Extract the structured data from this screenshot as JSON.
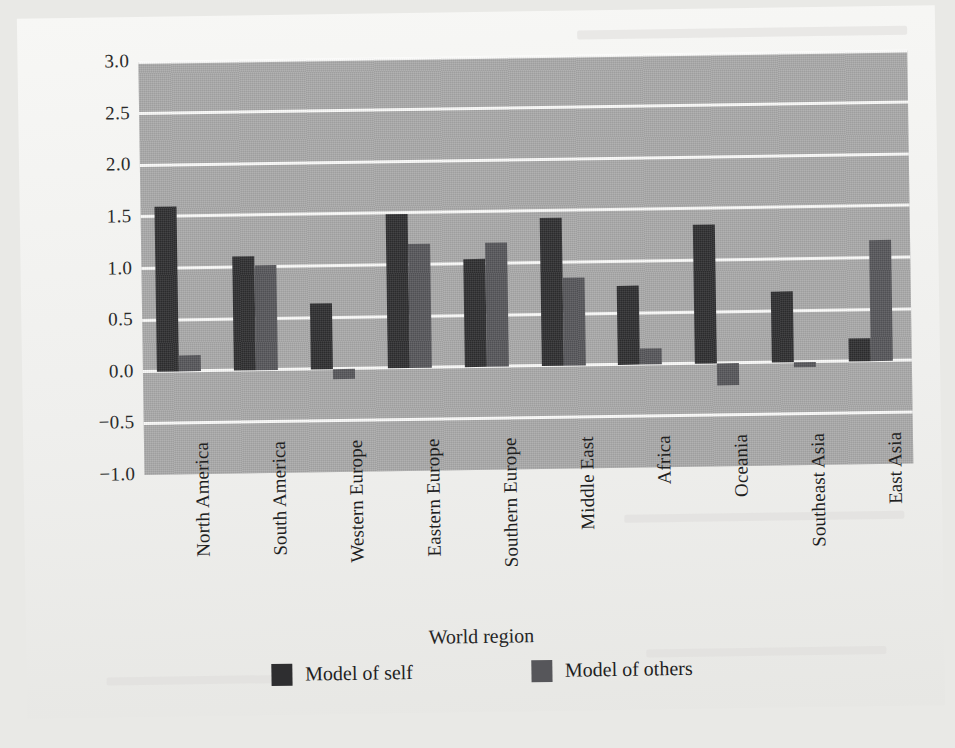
{
  "chart_data": {
    "type": "bar",
    "title": "",
    "xlabel": "World region",
    "ylabel": "Internal working models",
    "ylim": [
      -1.0,
      3.0
    ],
    "ytick_labels": [
      "3.0",
      "2.5",
      "2.0",
      "1.5",
      "1.0",
      "0.5",
      "0.0",
      "-0.5",
      "-1.0"
    ],
    "ytick_values": [
      3.0,
      2.5,
      2.0,
      1.5,
      1.0,
      0.5,
      0.0,
      -0.5,
      -1.0
    ],
    "grid": true,
    "grid_color": "#fbfbfa",
    "plot_background": "#a9a9a9",
    "legend_position": "bottom",
    "categories": [
      "North America",
      "South America",
      "Western Europe",
      "Eastern Europe",
      "Southern Europe",
      "Middle East",
      "Africa",
      "Oceania",
      "Southeast Asia",
      "East Asia"
    ],
    "series": [
      {
        "name": "Model of self",
        "color": "#2e2e30",
        "values": [
          1.6,
          1.1,
          0.64,
          1.49,
          1.04,
          1.43,
          0.76,
          1.34,
          0.69,
          0.22
        ]
      },
      {
        "name": "Model of others",
        "color": "#56565a",
        "values": [
          0.15,
          1.01,
          -0.1,
          1.2,
          1.2,
          0.85,
          0.15,
          -0.22,
          -0.05,
          1.17
        ]
      }
    ]
  },
  "legend": {
    "items": [
      {
        "label": "Model of self",
        "color": "#2e2e30"
      },
      {
        "label": "Model of others",
        "color": "#56565a"
      }
    ]
  },
  "axes": {
    "x_title": "World region",
    "y_title": "Internal working models"
  }
}
